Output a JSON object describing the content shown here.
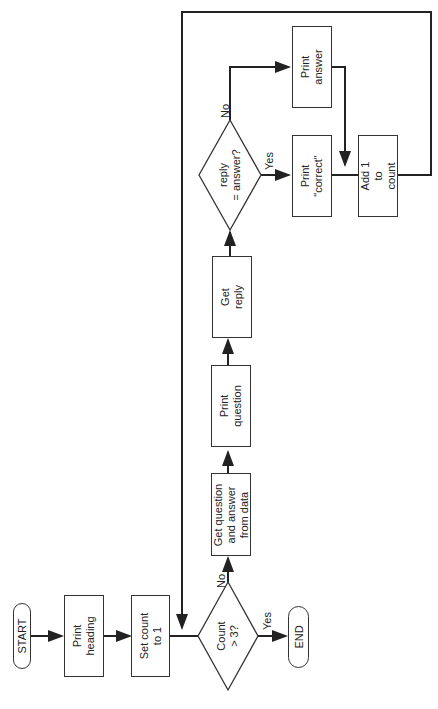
{
  "nodes": {
    "start": "START",
    "print_heading": "Print\nheading",
    "set_count": "Set count\nto 1",
    "count_check": "Count\n> 3?",
    "end": "END",
    "get_question": "Get question\nand answer\nfrom data",
    "print_question": "Print\nquestion",
    "get_reply": "Get\nreply",
    "reply_check": "reply\n= answer?",
    "print_correct": "Print\n\"correct\"",
    "print_answer": "Print\nanswer",
    "add_one": "Add 1\nto\ncount"
  },
  "edges": {
    "count_no": "No",
    "count_yes": "Yes",
    "reply_no": "No",
    "reply_yes": "Yes"
  }
}
